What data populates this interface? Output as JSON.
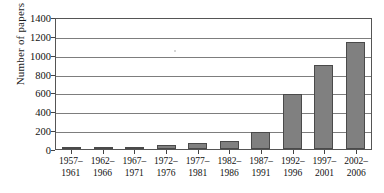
{
  "chart_data": {
    "type": "bar",
    "title": "",
    "xlabel": "",
    "ylabel": "Number of papers",
    "ylim": [
      0,
      1400
    ],
    "ytick_step": 200,
    "yticks": [
      0,
      200,
      400,
      600,
      800,
      1000,
      1200,
      1400
    ],
    "ytick_labels": [
      "0",
      "200",
      "400",
      "600",
      "800",
      "1000",
      "1200",
      "1400"
    ],
    "grid": true,
    "legend": "none",
    "bar_color": "#808080",
    "bar_edge_color": "#4a4a4a",
    "axis_color": "#555555",
    "categories": [
      "1957-1961",
      "1962-1966",
      "1967-1971",
      "1972-1976",
      "1977-1981",
      "1982-1986",
      "1987-1991",
      "1992-1996",
      "1997-2001",
      "2002-2006"
    ],
    "category_lines": [
      [
        "1957–",
        "1961"
      ],
      [
        "1962–",
        "1966"
      ],
      [
        "1967–",
        "1971"
      ],
      [
        "1972–",
        "1976"
      ],
      [
        "1977–",
        "1981"
      ],
      [
        "1982–",
        "1986"
      ],
      [
        "1987–",
        "1991"
      ],
      [
        "1992–",
        "1996"
      ],
      [
        "1997–",
        "2001"
      ],
      [
        "2002–",
        "2006"
      ]
    ],
    "values": [
      10,
      15,
      25,
      40,
      65,
      85,
      180,
      580,
      895,
      1140
    ]
  }
}
